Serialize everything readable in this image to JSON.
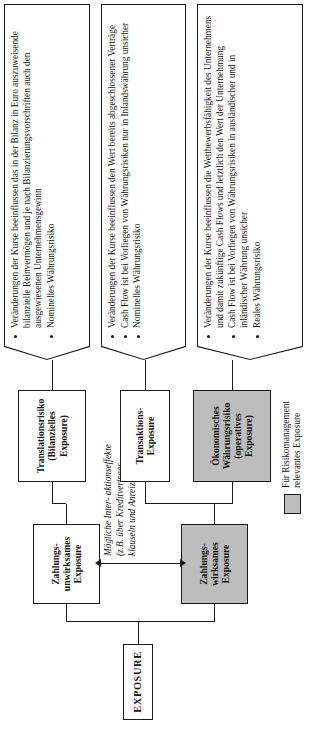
{
  "diagram": {
    "root": {
      "label": "EXPOSURE"
    },
    "payment_level": [
      {
        "id": "zahlungs-unwirksam",
        "lines": [
          "Zahlungs-",
          "unwirksames",
          "Exposure"
        ],
        "highlighted": false
      },
      {
        "id": "zahlungs-wirksam",
        "lines": [
          "Zahlungs-",
          "wirksames",
          "Exposure"
        ],
        "highlighted": true
      }
    ],
    "categories": [
      {
        "id": "translationsrisiko",
        "lines": [
          "Translationsrisiko",
          "(Bilanzielles",
          "Exposure)"
        ],
        "highlighted": false
      },
      {
        "id": "transaktions",
        "lines": [
          "Transaktions-",
          "Exposure"
        ],
        "highlighted": false
      },
      {
        "id": "oekonomisches",
        "lines": [
          "Ökonomisches",
          "Währungsrisiko",
          "(operatives",
          "Exposure)"
        ],
        "highlighted": true
      }
    ],
    "callouts": [
      {
        "id": "callout-translation",
        "bullets": [
          "Veränderungen der Kurse beeinflussen das in der Bilanz in Euro auszuweisende bilanzielle Reinvermögen und je nach Bilanzierungsvorschriften auch den ausgewiesenen Unternehmensgewinn",
          "Nominelles Währungsrisiko"
        ]
      },
      {
        "id": "callout-transaktion",
        "bullets": [
          "Veränderungen der Kurse beeinflussen den Wert bereits abgeschlossener Verträge",
          "Cash Flow ist bei Vorliegen von Währungsrisiken nur in Inlandswährung unsicher",
          "Nominelles Währungsrisiko"
        ]
      },
      {
        "id": "callout-oekonomisch",
        "bullets": [
          "Veränderungen der Kurse beeinflussen die Wettbewerbsfähigkeit des Unternehmens und damit zukünftige Cash Flows und letztlich den Wert der Unternehmung",
          "Cash Flow ist bei Vorliegen von Währungsrisiken in ausländischer und in inländischer Währung unsicher",
          "Reales Währungsrisiko"
        ]
      }
    ],
    "interaction_note": {
      "lines": [
        "Mögliche Inter-",
        "aktionseffekte (z.B.",
        "über Kreditvertrags-",
        "klauseln und",
        "Anreizsysteme)"
      ]
    },
    "legend": {
      "swatch_color": "#bdbdbd",
      "lines": [
        "Für Risikomanagement",
        "relevantes Exposure"
      ]
    }
  }
}
